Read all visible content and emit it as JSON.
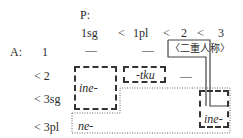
{
  "header": {
    "p_label": "P:",
    "columns": [
      "1sg",
      "<",
      "1pl",
      "<",
      "2",
      "<",
      "3"
    ]
  },
  "rows": [
    {
      "label": "A:",
      "sub": "1",
      "cells": [
        "—",
        "—"
      ]
    },
    {
      "label": "< 2",
      "cells": [
        "—"
      ]
    },
    {
      "label": "< 3sg"
    },
    {
      "label": "< 3pl"
    }
  ],
  "regions": {
    "dual_person_box": "〈二重人称〉",
    "ine_left": "ine-",
    "tku": "-tku",
    "ne": "ne-",
    "ine_right": "ine-"
  }
}
